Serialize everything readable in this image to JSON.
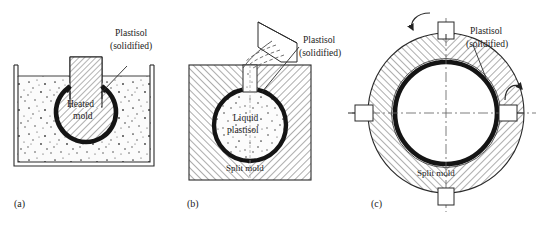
{
  "figure": {
    "background_color": "#ffffff",
    "ink_color": "#222222",
    "plastisol_ring_color": "#1a1a1a",
    "hatch_color": "#555555",
    "speckle_color": "#444444"
  },
  "panels": [
    {
      "id": "a",
      "label": "(a)",
      "caption_stage": "Heated mold dipped in liquid plastisol",
      "labels": {
        "plastisol_line1": "Plastisol",
        "plastisol_line2": "(solidified)",
        "mold_line1": "Heated",
        "mold_line2": "mold"
      },
      "elements": [
        "open-tank",
        "liquid-plastisol-bath",
        "heated-mold-sphere",
        "solidified-plastisol-skin",
        "mold-stem"
      ]
    },
    {
      "id": "b",
      "label": "(b)",
      "caption_stage": "Liquid plastisol poured into split mold",
      "labels": {
        "plastisol_line1": "Plastisol",
        "plastisol_line2": "(solidified)",
        "liquid_line1": "Liquid",
        "liquid_line2": "plastisol",
        "split_mold": "Split mold"
      },
      "elements": [
        "split-mold-block",
        "pouring-vessel",
        "pour-stream",
        "mold-cavity",
        "solidified-plastisol-skin",
        "sprue-opening"
      ]
    },
    {
      "id": "c",
      "label": "(c)",
      "caption_stage": "Rotational molding of split mold about two axes",
      "labels": {
        "plastisol_line1": "Plastisol",
        "plastisol_line2": "(solidified)",
        "split_mold": "Split mold"
      },
      "elements": [
        "split-mold-annulus",
        "solidified-plastisol-ring",
        "hollow-cavity",
        "vertical-centerline",
        "horizontal-centerline",
        "top-trunnion",
        "bottom-trunnion",
        "right-trunnion",
        "left-shaft-stub",
        "rotation-arrow-vertical-axis",
        "rotation-arrow-horizontal-axis"
      ]
    }
  ]
}
